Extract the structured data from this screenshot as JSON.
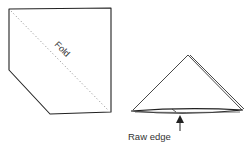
{
  "diagram": {
    "left_figure": {
      "description": "Square napkin with one corner cut off, dotted diagonal fold line",
      "fold_label": "Fold"
    },
    "right_figure": {
      "description": "Napkin folded into triangle",
      "raw_edge_label": "Raw edge"
    },
    "colors": {
      "stroke": "#222222",
      "fold_line": "#888888",
      "text": "#333333"
    }
  }
}
